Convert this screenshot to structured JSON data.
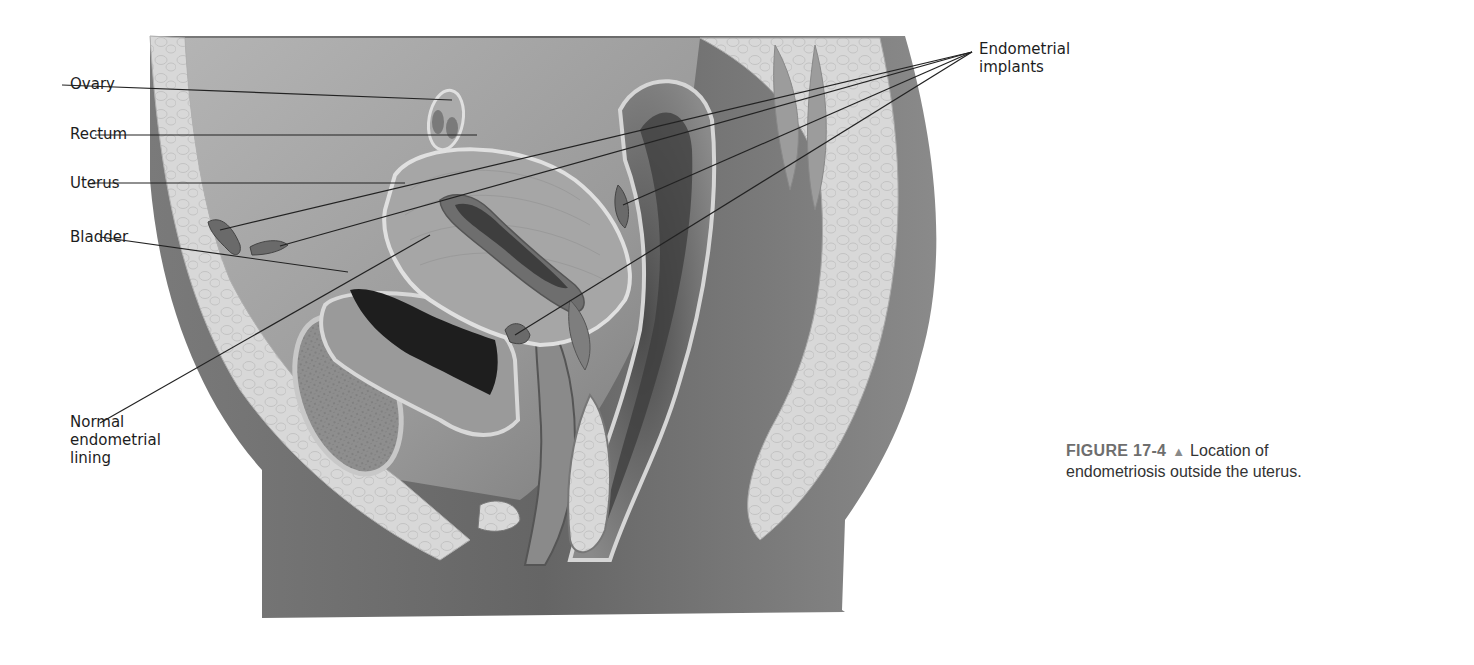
{
  "labels": {
    "ovary": "Ovary",
    "rectum": "Rectum",
    "uterus": "Uterus",
    "bladder": "Bladder",
    "normal_lining": [
      "Normal",
      "endometrial",
      "lining"
    ],
    "implants": [
      "Endometrial",
      "implants"
    ]
  },
  "caption": {
    "figure_number": "FIGURE 17-4",
    "marker": "▲",
    "text_line1": "Location of",
    "text_line2": "endometriosis outside the uterus."
  },
  "colors": {
    "background": "#ffffff",
    "body_dark": "#5e5e5e",
    "body_mid": "#8c8c8c",
    "cavity": "#9a9a9a",
    "fat_light": "#d9d9d9",
    "organ_wall": "#a8a8a8",
    "lumen_dark": "#1e1e1e",
    "leader_line": "#222222"
  }
}
